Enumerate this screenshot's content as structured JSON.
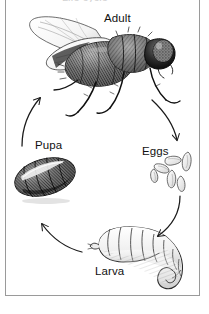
{
  "figure": {
    "name": "housefly-life-cycle-diagram",
    "title_fragment": "Life cycle",
    "stages": [
      {
        "id": "adult",
        "label": "Adult",
        "icon": "adult-fly-icon"
      },
      {
        "id": "eggs",
        "label": "Eggs",
        "icon": "fly-eggs-icon"
      },
      {
        "id": "larva",
        "label": "Larva",
        "icon": "fly-larva-icon"
      },
      {
        "id": "pupa",
        "label": "Pupa",
        "icon": "fly-pupa-icon"
      }
    ],
    "arrows": [
      {
        "id": "adult-to-eggs",
        "from": "Adult",
        "to": "Eggs"
      },
      {
        "id": "eggs-to-larva",
        "from": "Eggs",
        "to": "Larva"
      },
      {
        "id": "larva-to-pupa",
        "from": "Larva",
        "to": "Pupa"
      },
      {
        "id": "pupa-to-adult",
        "from": "Pupa",
        "to": "Adult"
      }
    ],
    "colors": {
      "ink": "#111111",
      "frame": "#9a9a9a",
      "background": "#ffffff",
      "shading_dark": "#3a3a3a",
      "shading_mid": "#777777",
      "shading_light": "#c9c9c9"
    }
  }
}
